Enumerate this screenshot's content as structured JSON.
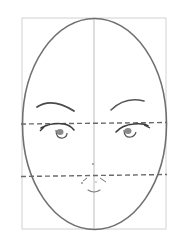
{
  "diagram": {
    "elements": [
      "bounding-rectangle",
      "head-oval",
      "vertical-center-line",
      "eye-line (dashed)",
      "nose-line (dashed)",
      "left-eyebrow",
      "right-eyebrow",
      "left-eye",
      "right-eye",
      "nose",
      "mouth"
    ],
    "colors": {
      "background": "#ffffff",
      "outline": "#6e6e6e",
      "guide": "#c8c8c8",
      "dashed": "#6a6a6a",
      "features": "#4a4a4a"
    }
  }
}
